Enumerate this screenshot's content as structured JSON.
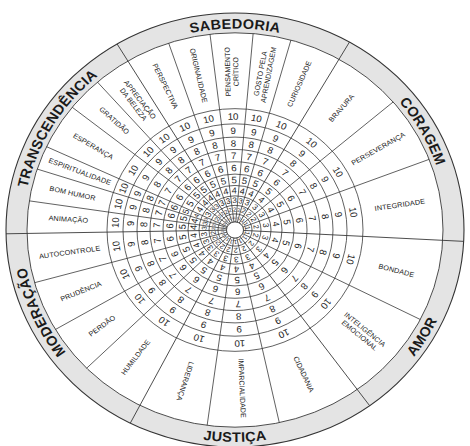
{
  "diagram": {
    "type": "strengths-wheel",
    "scale_values": [
      "1",
      "2",
      "3",
      "4",
      "5",
      "6",
      "7",
      "8",
      "9",
      "10"
    ],
    "colors": {
      "band": "#e4e4e4",
      "lines": "#333333",
      "text": "#222222",
      "background": "#ffffff"
    }
  },
  "virtues": [
    {
      "name": "SABEDORIA",
      "label_angle": 0,
      "orientation": "outward",
      "start": -31,
      "end": 30,
      "strengths": [
        {
          "label": [
            "PERSPECTIVA"
          ],
          "start": -31,
          "end": -18.6
        },
        {
          "label": [
            "ORIGINALIDADE"
          ],
          "start": -18.6,
          "end": -6.9
        },
        {
          "label": [
            "PENSAMENTO",
            "CRÍTICO"
          ],
          "start": -6.9,
          "end": 5
        },
        {
          "label": [
            "GOSTO PELA",
            "APRENDIZAGEM"
          ],
          "start": 5,
          "end": 15.6
        },
        {
          "label": [
            "CURIOSIDADE"
          ],
          "start": 15.6,
          "end": 30
        }
      ]
    },
    {
      "name": "CORAGEM",
      "label_angle": 61,
      "orientation": "outward",
      "start": 30,
      "end": 93,
      "strengths": [
        {
          "label": [
            "BRAVURA"
          ],
          "start": 30,
          "end": 49.5
        },
        {
          "label": [
            "PERSEVERANÇA"
          ],
          "start": 49.5,
          "end": 69
        },
        {
          "label": [
            "INTEGRIDADE"
          ],
          "start": 69,
          "end": 93
        }
      ]
    },
    {
      "name": "AMOR",
      "label_angle": 121,
      "orientation": "inward",
      "start": 93,
      "end": 144,
      "strengths": [
        {
          "label": [
            "BONDADE"
          ],
          "start": 93,
          "end": 117
        },
        {
          "label": [
            "INTELIGÊNCIA",
            "EMOCIONAL"
          ],
          "start": 117,
          "end": 144
        }
      ]
    },
    {
      "name": "JUSTIÇA",
      "label_angle": 180,
      "orientation": "inward",
      "start": 144,
      "end": 207.2,
      "strengths": [
        {
          "label": [
            "CIDADANIA"
          ],
          "start": 144,
          "end": 167.7
        },
        {
          "label": [
            "IMPARCIALIDADE"
          ],
          "start": 167.7,
          "end": 187.7
        },
        {
          "label": [
            "LIDERANÇA"
          ],
          "start": 187.7,
          "end": 207.2
        }
      ]
    },
    {
      "name": "MODERAÇÃO",
      "label_angle": 246,
      "orientation": "outward",
      "start": 207.2,
      "end": 269,
      "strengths": [
        {
          "label": [
            "HUMILDADE"
          ],
          "start": 207.2,
          "end": 225.5
        },
        {
          "label": [
            "PERDÃO"
          ],
          "start": 225.5,
          "end": 239.7
        },
        {
          "label": [
            "PRUDÊNCIA"
          ],
          "start": 239.7,
          "end": 254.5
        },
        {
          "label": [
            "AUTOCONTROLE"
          ],
          "start": 254.5,
          "end": 269
        }
      ]
    },
    {
      "name": "TRANSCENDÊNCIA",
      "label_angle": 301,
      "orientation": "outward",
      "start": 269,
      "end": 329,
      "strengths": [
        {
          "label": [
            "ANIMAÇÃO"
          ],
          "start": 269,
          "end": 278.5
        },
        {
          "label": [
            "BOM HUMOR"
          ],
          "start": 278.5,
          "end": 288
        },
        {
          "label": [
            "ESPIRITUALIDADE"
          ],
          "start": 288,
          "end": 295
        },
        {
          "label": [
            "ESPERANÇA"
          ],
          "start": 295,
          "end": 308.5
        },
        {
          "label": [
            "GRATIDÃO"
          ],
          "start": 308.5,
          "end": 318.6
        },
        {
          "label": [
            "APRECIAÇÃO",
            "DA BELEZA"
          ],
          "start": 318.6,
          "end": 329
        }
      ]
    }
  ]
}
